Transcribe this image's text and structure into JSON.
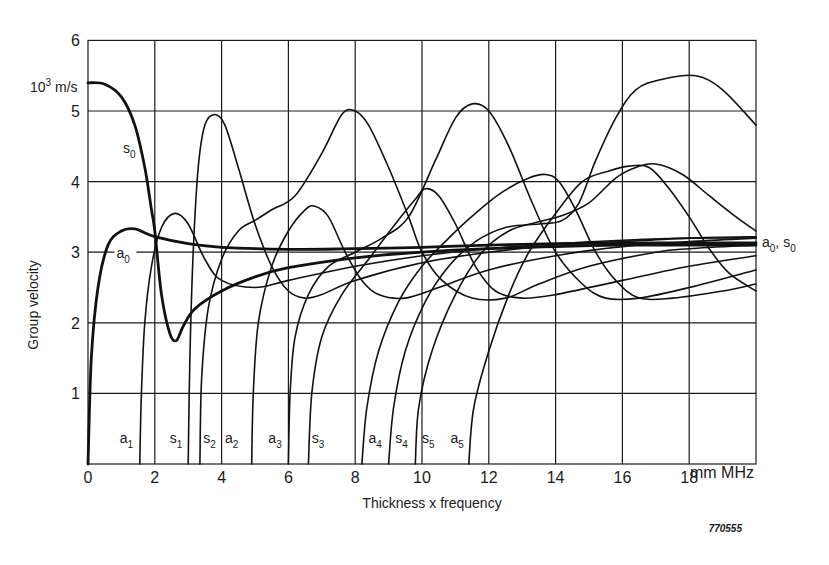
{
  "chart_data": {
    "type": "line",
    "title": "",
    "xlabel": "Thickness x frequency",
    "x_unit": "mm MHz",
    "ylabel": "Group velocity",
    "y_unit": "10^3 m/s",
    "xlim": [
      0,
      20
    ],
    "ylim": [
      0,
      6
    ],
    "x_ticks": [
      0,
      2,
      4,
      6,
      8,
      10,
      12,
      14,
      16,
      18
    ],
    "y_ticks": [
      1,
      2,
      3,
      4,
      5,
      6
    ],
    "grid": true,
    "legend": "none (curves labeled inline)",
    "figure_id": "770555",
    "right_label": "a0, s0",
    "series": [
      {
        "name": "s0",
        "bold": true,
        "points": [
          [
            0,
            5.4
          ],
          [
            0.5,
            5.38
          ],
          [
            1.0,
            5.2
          ],
          [
            1.4,
            4.8
          ],
          [
            1.7,
            4.2
          ],
          [
            1.9,
            3.6
          ],
          [
            2.0,
            3.3
          ],
          [
            2.2,
            2.4
          ],
          [
            2.45,
            1.85
          ],
          [
            2.65,
            1.75
          ],
          [
            2.85,
            1.95
          ],
          [
            3.2,
            2.2
          ],
          [
            4,
            2.45
          ],
          [
            5,
            2.65
          ],
          [
            6,
            2.78
          ],
          [
            8,
            2.92
          ],
          [
            10,
            3.0
          ],
          [
            12,
            3.05
          ],
          [
            14,
            3.08
          ],
          [
            16,
            3.1
          ],
          [
            18,
            3.1
          ],
          [
            20,
            3.1
          ]
        ]
      },
      {
        "name": "a0",
        "bold": true,
        "points": [
          [
            0,
            0
          ],
          [
            0.1,
            1.5
          ],
          [
            0.3,
            2.5
          ],
          [
            0.6,
            3.1
          ],
          [
            1.0,
            3.3
          ],
          [
            1.4,
            3.33
          ],
          [
            2.0,
            3.22
          ],
          [
            3,
            3.12
          ],
          [
            4,
            3.07
          ],
          [
            6,
            3.04
          ],
          [
            8,
            3.05
          ],
          [
            10,
            3.07
          ],
          [
            12,
            3.1
          ],
          [
            14,
            3.12
          ],
          [
            16,
            3.13
          ],
          [
            18,
            3.13
          ],
          [
            20,
            3.13
          ]
        ]
      },
      {
        "name": "a1",
        "bold": false,
        "points": [
          [
            1.55,
            0
          ],
          [
            1.6,
            1
          ],
          [
            1.7,
            2
          ],
          [
            1.9,
            2.8
          ],
          [
            2.2,
            3.35
          ],
          [
            2.6,
            3.55
          ],
          [
            3.0,
            3.4
          ],
          [
            3.5,
            2.9
          ],
          [
            4,
            2.6
          ],
          [
            5,
            2.5
          ],
          [
            6,
            2.6
          ],
          [
            8,
            2.8
          ],
          [
            10,
            2.95
          ],
          [
            12,
            3.05
          ],
          [
            14,
            3.12
          ],
          [
            16,
            3.17
          ],
          [
            18,
            3.2
          ],
          [
            20,
            3.2
          ]
        ]
      },
      {
        "name": "s1",
        "bold": false,
        "points": [
          [
            3.0,
            0
          ],
          [
            3.05,
            1.5
          ],
          [
            3.15,
            3
          ],
          [
            3.3,
            4.2
          ],
          [
            3.5,
            4.8
          ],
          [
            3.8,
            4.95
          ],
          [
            4.1,
            4.8
          ],
          [
            4.5,
            4.2
          ],
          [
            5,
            3.4
          ],
          [
            5.5,
            2.8
          ],
          [
            6,
            2.45
          ],
          [
            6.5,
            2.35
          ],
          [
            7,
            2.4
          ],
          [
            8,
            2.6
          ],
          [
            10,
            2.85
          ],
          [
            12,
            3.0
          ],
          [
            14,
            3.1
          ],
          [
            16,
            3.15
          ],
          [
            18,
            3.2
          ],
          [
            20,
            3.22
          ]
        ]
      },
      {
        "name": "s2",
        "bold": false,
        "points": [
          [
            3.35,
            0
          ],
          [
            3.4,
            1.2
          ],
          [
            3.6,
            2.2
          ],
          [
            4,
            2.9
          ],
          [
            4.5,
            3.3
          ],
          [
            5,
            3.45
          ],
          [
            5.5,
            3.6
          ],
          [
            6.2,
            3.8
          ],
          [
            7,
            4.4
          ],
          [
            7.6,
            4.95
          ],
          [
            8.0,
            5.0
          ],
          [
            8.4,
            4.8
          ],
          [
            9,
            4.2
          ],
          [
            9.6,
            3.5
          ],
          [
            10,
            3.0
          ],
          [
            10.6,
            2.6
          ],
          [
            11.5,
            2.35
          ],
          [
            12.5,
            2.35
          ],
          [
            13.5,
            2.55
          ],
          [
            15,
            2.8
          ],
          [
            17,
            3.0
          ],
          [
            18,
            3.05
          ],
          [
            20,
            3.1
          ]
        ]
      },
      {
        "name": "a2",
        "bold": false,
        "points": [
          [
            4.9,
            0
          ],
          [
            4.95,
            1
          ],
          [
            5.1,
            2
          ],
          [
            5.5,
            2.8
          ],
          [
            6,
            3.3
          ],
          [
            6.5,
            3.6
          ],
          [
            6.8,
            3.65
          ],
          [
            7.2,
            3.5
          ],
          [
            7.7,
            3.0
          ],
          [
            8.2,
            2.6
          ],
          [
            8.7,
            2.4
          ],
          [
            9.5,
            2.35
          ],
          [
            10.5,
            2.5
          ],
          [
            12,
            2.75
          ],
          [
            14,
            2.95
          ],
          [
            16,
            3.08
          ],
          [
            18,
            3.15
          ],
          [
            20,
            3.2
          ]
        ]
      },
      {
        "name": "a3",
        "bold": false,
        "points": [
          [
            6.0,
            0
          ],
          [
            6.05,
            1
          ],
          [
            6.2,
            1.8
          ],
          [
            6.6,
            2.4
          ],
          [
            7.2,
            2.8
          ],
          [
            8,
            3.0
          ],
          [
            8.8,
            3.2
          ],
          [
            9.6,
            3.5
          ],
          [
            10.4,
            4.3
          ],
          [
            11.0,
            4.9
          ],
          [
            11.5,
            5.1
          ],
          [
            12.0,
            5.0
          ],
          [
            12.6,
            4.5
          ],
          [
            13.3,
            3.7
          ],
          [
            14,
            3.0
          ],
          [
            14.8,
            2.55
          ],
          [
            15.5,
            2.35
          ],
          [
            16.5,
            2.35
          ],
          [
            18,
            2.5
          ],
          [
            20,
            2.75
          ]
        ]
      },
      {
        "name": "s3",
        "bold": false,
        "points": [
          [
            6.6,
            0
          ],
          [
            6.7,
            1
          ],
          [
            7.0,
            1.8
          ],
          [
            7.6,
            2.4
          ],
          [
            8.4,
            2.9
          ],
          [
            9.2,
            3.4
          ],
          [
            9.8,
            3.75
          ],
          [
            10.1,
            3.9
          ],
          [
            10.5,
            3.8
          ],
          [
            11,
            3.4
          ],
          [
            11.6,
            2.8
          ],
          [
            12.2,
            2.45
          ],
          [
            13,
            2.35
          ],
          [
            14,
            2.4
          ],
          [
            16,
            2.6
          ],
          [
            18,
            2.8
          ],
          [
            20,
            2.95
          ]
        ]
      },
      {
        "name": "a4",
        "bold": false,
        "points": [
          [
            8.2,
            0
          ],
          [
            8.35,
            0.8
          ],
          [
            8.7,
            1.6
          ],
          [
            9.3,
            2.3
          ],
          [
            10,
            2.8
          ],
          [
            10.8,
            3.2
          ],
          [
            11.6,
            3.55
          ],
          [
            12.4,
            3.85
          ],
          [
            13.2,
            4.05
          ],
          [
            13.7,
            4.1
          ],
          [
            14.1,
            4.0
          ],
          [
            14.6,
            3.6
          ],
          [
            15.2,
            3.0
          ],
          [
            15.8,
            2.6
          ],
          [
            16.5,
            2.35
          ],
          [
            17.5,
            2.35
          ],
          [
            19,
            2.45
          ],
          [
            20,
            2.55
          ]
        ]
      },
      {
        "name": "s4",
        "bold": false,
        "points": [
          [
            9.0,
            0
          ],
          [
            9.15,
            0.8
          ],
          [
            9.5,
            1.6
          ],
          [
            10.1,
            2.3
          ],
          [
            10.8,
            2.8
          ],
          [
            11.6,
            3.15
          ],
          [
            12.5,
            3.35
          ],
          [
            13.5,
            3.4
          ],
          [
            14.2,
            3.45
          ],
          [
            14.7,
            3.7
          ],
          [
            15.2,
            4.3
          ],
          [
            15.8,
            4.9
          ],
          [
            16.4,
            5.3
          ],
          [
            17.2,
            5.45
          ],
          [
            18.2,
            5.5
          ],
          [
            19,
            5.3
          ],
          [
            20,
            4.8
          ]
        ]
      },
      {
        "name": "s5",
        "bold": false,
        "points": [
          [
            9.8,
            0
          ],
          [
            9.9,
            0.8
          ],
          [
            10.3,
            1.6
          ],
          [
            11,
            2.4
          ],
          [
            11.8,
            3.0
          ],
          [
            12.6,
            3.3
          ],
          [
            13.4,
            3.42
          ],
          [
            14.2,
            3.52
          ],
          [
            15.0,
            3.7
          ],
          [
            15.8,
            4.05
          ],
          [
            16.4,
            4.2
          ],
          [
            17.0,
            4.25
          ],
          [
            17.8,
            4.1
          ],
          [
            18.6,
            3.8
          ],
          [
            19.4,
            3.5
          ],
          [
            20,
            3.3
          ]
        ]
      },
      {
        "name": "a5",
        "bold": false,
        "points": [
          [
            11.4,
            0
          ],
          [
            11.55,
            0.8
          ],
          [
            12,
            1.6
          ],
          [
            12.6,
            2.4
          ],
          [
            13.2,
            3.0
          ],
          [
            14,
            3.55
          ],
          [
            14.8,
            4.0
          ],
          [
            15.6,
            4.15
          ],
          [
            16.2,
            4.22
          ],
          [
            16.8,
            4.2
          ],
          [
            17.4,
            3.9
          ],
          [
            18,
            3.5
          ],
          [
            18.6,
            3.05
          ],
          [
            19.2,
            2.7
          ],
          [
            20,
            2.45
          ]
        ]
      }
    ],
    "inline_labels": [
      {
        "text": "s",
        "sub": "0",
        "x": 1.05,
        "y": 4.4
      },
      {
        "text": "a",
        "sub": "0",
        "x": 0.85,
        "y": 2.92
      },
      {
        "text": "a",
        "sub": "1",
        "x": 0.95,
        "y": 0.3
      },
      {
        "text": "s",
        "sub": "1",
        "x": 2.45,
        "y": 0.3
      },
      {
        "text": "s",
        "sub": "2",
        "x": 3.45,
        "y": 0.3
      },
      {
        "text": "a",
        "sub": "2",
        "x": 4.1,
        "y": 0.3
      },
      {
        "text": "a",
        "sub": "3",
        "x": 5.4,
        "y": 0.3
      },
      {
        "text": "s",
        "sub": "3",
        "x": 6.7,
        "y": 0.3
      },
      {
        "text": "a",
        "sub": "4",
        "x": 8.4,
        "y": 0.3
      },
      {
        "text": "s",
        "sub": "4",
        "x": 9.2,
        "y": 0.3
      },
      {
        "text": "s",
        "sub": "5",
        "x": 10.0,
        "y": 0.3
      },
      {
        "text": "a",
        "sub": "5",
        "x": 10.85,
        "y": 0.3
      }
    ]
  },
  "text": {
    "y_unit_label": "10",
    "y_unit_sup": "3",
    "y_unit_rest": " m/s",
    "x_unit_label": "mm MHz",
    "xlabel": "Thickness x frequency",
    "ylabel": "Group velocity",
    "figure_id": "770555",
    "right_label_a": "a",
    "right_label_a_sub": "0",
    "right_label_sep": ", ",
    "right_label_s": "s",
    "right_label_s_sub": "0"
  }
}
